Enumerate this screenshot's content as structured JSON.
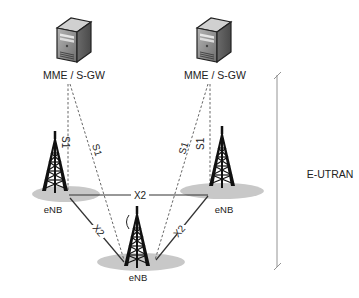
{
  "diagram": {
    "core_nodes": [
      {
        "id": "mme-left",
        "label": "MME / S-GW",
        "icon": "server-icon"
      },
      {
        "id": "mme-right",
        "label": "MME / S-GW",
        "icon": "server-icon"
      }
    ],
    "enbs": [
      {
        "id": "enb-left",
        "label": "eNB",
        "icon": "cell-tower-icon"
      },
      {
        "id": "enb-right",
        "label": "eNB",
        "icon": "cell-tower-icon"
      },
      {
        "id": "enb-bottom",
        "label": "eNB",
        "icon": "cell-tower-icon"
      }
    ],
    "interfaces": {
      "s1": "S1",
      "x2": "X2"
    },
    "links": [
      {
        "from": "mme-left",
        "to": "enb-left",
        "type": "S1",
        "style": "dashed"
      },
      {
        "from": "mme-left",
        "to": "enb-bottom",
        "type": "S1",
        "style": "dashed"
      },
      {
        "from": "mme-right",
        "to": "enb-right",
        "type": "S1",
        "style": "dashed"
      },
      {
        "from": "mme-right",
        "to": "enb-bottom",
        "type": "S1",
        "style": "dashed"
      },
      {
        "from": "enb-left",
        "to": "enb-right",
        "type": "X2",
        "style": "solid"
      },
      {
        "from": "enb-left",
        "to": "enb-bottom",
        "type": "X2",
        "style": "solid"
      },
      {
        "from": "enb-right",
        "to": "enb-bottom",
        "type": "X2",
        "style": "solid"
      }
    ],
    "region_label": "E-UTRAN",
    "colors": {
      "line": "#333333",
      "dashed": "#555555",
      "ellipse": "#c8c8c8",
      "server_body": "#8a8a8a",
      "tower": "#1a1a1a"
    }
  }
}
